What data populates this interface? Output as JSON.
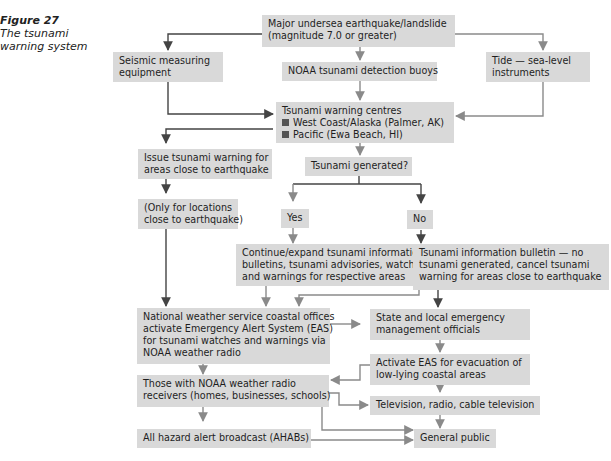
{
  "caption": {
    "figure_label": "Figure 27",
    "title_line1": "The tsunami",
    "title_line2": "warning system"
  },
  "nodes": {
    "earthquake": {
      "line1": "Major undersea earthquake/landslide",
      "line2": "(magnitude 7.0 or greater)"
    },
    "seismic": {
      "line1": "Seismic measuring",
      "line2": "equipment"
    },
    "buoys": {
      "line1": "NOAA tsunami detection buoys"
    },
    "tide": {
      "line1": "Tide — sea-level",
      "line2": "instruments"
    },
    "centres": {
      "line1": "Tsunami warning centres",
      "item1": "West Coast/Alaska (Palmer, AK)",
      "item2": "Pacific (Ewa Beach, HI)"
    },
    "issue_warning": {
      "line1": "Issue tsunami warning for",
      "line2": "areas close to earthquake"
    },
    "generated": {
      "line1": "Tsunami generated?"
    },
    "only_locations": {
      "line1": "(Only for locations",
      "line2": "close to earthquake)"
    },
    "yes": {
      "line1": "Yes"
    },
    "no": {
      "line1": "No"
    },
    "continue": {
      "line1": "Continue/expand tsunami information",
      "line2": "bulletins, tsunami advisories, watches",
      "line3": "and warnings for respective areas"
    },
    "bulletin": {
      "line1": "Tsunami information bulletin — no",
      "line2": "tsunami generated, cancel tsunami",
      "line3": "warning for areas close to earthquake"
    },
    "nws": {
      "line1": "National weather service coastal offices",
      "line2": "activate Emergency Alert System (EAS)",
      "line3": "for tsunami watches and warnings via",
      "line4": "NOAA weather radio"
    },
    "state": {
      "line1": "State and local emergency",
      "line2": "management officials"
    },
    "activate_eas": {
      "line1": "Activate EAS for evacuation of",
      "line2": "low-lying coastal areas"
    },
    "receivers": {
      "line1": "Those with NOAA weather radio",
      "line2": "receivers (homes, businesses, schools)"
    },
    "tv": {
      "line1": "Television, radio, cable television"
    },
    "ahab": {
      "line1": "All hazard alert broadcast (AHABs)"
    },
    "public": {
      "line1": "General public"
    }
  },
  "colors": {
    "box_fill": "#d9d9d9",
    "arrow_dark": "#444444",
    "arrow_gray": "#8a8a8a"
  }
}
